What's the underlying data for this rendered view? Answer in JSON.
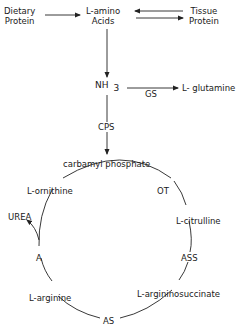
{
  "nodes": {
    "dietary_protein": "Dietary\nProtein",
    "dietary_l1": "Dietary",
    "dietary_l2": "Protein",
    "amino_l1": "L-amino",
    "amino_l2": "Acids",
    "tissue_l1": "Tissue",
    "tissue_l2": "Protein",
    "nh3": "NH",
    "nh3_sub": "3",
    "glutamine": "L- glutamine",
    "carbamyl_phosphate": "carbamyl phosphate",
    "ornithine": "L-ornithine",
    "citrulline": "L-citrulline",
    "argininosuccinate": "L-argininosuccinate",
    "arginine": "L-arginine",
    "urea": "UREA"
  },
  "enzymes": {
    "gs": "GS",
    "cps": "CPS",
    "ot": "OT",
    "ass": "ASS",
    "as": "AS",
    "a": "A"
  },
  "colors": {
    "line": "#222222",
    "text": "#1a1a1a",
    "background": "#ffffff"
  }
}
